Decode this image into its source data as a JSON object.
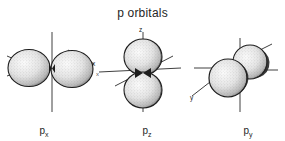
{
  "figure": {
    "title": "p orbitals",
    "background_color": "#ffffff",
    "ink_color": "#1a1a1a"
  },
  "orbitals": [
    {
      "id": "px",
      "caption_symbol": "p",
      "caption_subscript": "x",
      "caption_full": "px",
      "axis_label": "x",
      "axis_label_2": "",
      "lobe_orientation": "horizontal",
      "lobe_count": 2
    },
    {
      "id": "pz",
      "caption_symbol": "p",
      "caption_subscript": "z",
      "caption_full": "pz",
      "axis_label": "z",
      "axis_label_2": "x",
      "lobe_orientation": "vertical",
      "lobe_count": 2
    },
    {
      "id": "py",
      "caption_symbol": "p",
      "caption_subscript": "y",
      "caption_full": "py",
      "axis_label": "y",
      "axis_label_2": "",
      "lobe_orientation": "diagonal",
      "lobe_count": 2
    }
  ]
}
